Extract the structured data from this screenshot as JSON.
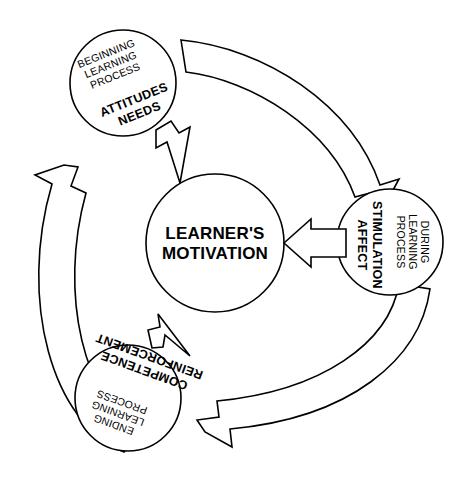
{
  "diagram": {
    "title": "LEARNER'S MOTIVATION",
    "type": "cycle-diagram",
    "stroke_color": "#000000",
    "fill_color": "#ffffff",
    "center": {
      "line1": "LEARNER'S",
      "line2": "MOTIVATION"
    },
    "nodes": [
      {
        "id": "beginning",
        "position": "top",
        "phase_line1": "BEGINNING",
        "phase_line2": "LEARNING",
        "phase_line3": "PROCESS",
        "factor_line1": "ATTITUDES",
        "factor_line2": "NEEDS",
        "rotation": -22
      },
      {
        "id": "during",
        "position": "right",
        "phase_line1": "DURING",
        "phase_line2": "LEARNING",
        "phase_line3": "PROCESS",
        "factor_line1": "STIMULATION",
        "factor_line2": "AFFECT",
        "rotation": 90
      },
      {
        "id": "ending",
        "position": "bottom",
        "phase_line1": "ENDING",
        "phase_line2": "LEARNING",
        "phase_line3": "PROCESS",
        "factor_line1": "COMPETENCE",
        "factor_line2": "REINFORCEMENT",
        "rotation": 200
      }
    ],
    "arrows": [
      {
        "id": "beginning-to-center",
        "from": "beginning",
        "to": "center",
        "style": "straight-block"
      },
      {
        "id": "beginning-to-during",
        "from": "beginning",
        "to": "during",
        "style": "curved-block"
      },
      {
        "id": "during-to-center",
        "from": "during",
        "to": "center",
        "style": "straight-block"
      },
      {
        "id": "during-to-ending",
        "from": "during",
        "to": "ending",
        "style": "curved-block"
      },
      {
        "id": "ending-to-center",
        "from": "ending",
        "to": "center",
        "style": "straight-block"
      },
      {
        "id": "ending-to-beginning",
        "from": "ending",
        "to": "beginning",
        "style": "curved-block"
      }
    ]
  }
}
